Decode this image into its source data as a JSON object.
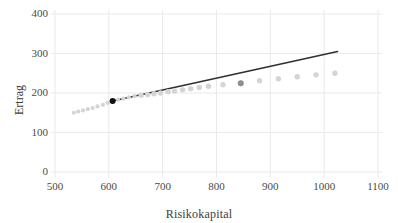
{
  "chart_data": {
    "type": "scatter",
    "title": "",
    "xlabel": "Risikokapital",
    "ylabel": "Ertrag",
    "xlim": [
      470,
      1140
    ],
    "ylim": [
      0,
      430
    ],
    "xticks": [
      500,
      600,
      700,
      800,
      900,
      1000,
      1100
    ],
    "yticks": [
      0,
      100,
      200,
      300,
      400
    ],
    "xtick_labels": [
      "500",
      "600",
      "700",
      "800",
      "900",
      "1000",
      "1100"
    ],
    "ytick_labels": [
      "0",
      "100",
      "200",
      "300",
      "400"
    ],
    "grid": true,
    "grid_color": "#e9e9ee",
    "legend": "none",
    "series": [
      {
        "name": "Effizienzkurve",
        "type": "scatter",
        "marker": "circle",
        "color": "#d4d4d4",
        "points": [
          {
            "x": 535,
            "y": 150
          },
          {
            "x": 543,
            "y": 153
          },
          {
            "x": 552,
            "y": 156
          },
          {
            "x": 561,
            "y": 159
          },
          {
            "x": 570,
            "y": 162
          },
          {
            "x": 579,
            "y": 166
          },
          {
            "x": 589,
            "y": 170
          },
          {
            "x": 598,
            "y": 175
          },
          {
            "x": 607,
            "y": 180
          },
          {
            "x": 617,
            "y": 183
          },
          {
            "x": 627,
            "y": 186
          },
          {
            "x": 637,
            "y": 189
          },
          {
            "x": 648,
            "y": 192
          },
          {
            "x": 660,
            "y": 194
          },
          {
            "x": 672,
            "y": 196
          },
          {
            "x": 684,
            "y": 198
          },
          {
            "x": 696,
            "y": 200
          },
          {
            "x": 710,
            "y": 203
          },
          {
            "x": 722,
            "y": 205
          },
          {
            "x": 737,
            "y": 208
          },
          {
            "x": 752,
            "y": 211
          },
          {
            "x": 768,
            "y": 214
          },
          {
            "x": 785,
            "y": 217
          },
          {
            "x": 812,
            "y": 221
          },
          {
            "x": 845,
            "y": 225
          },
          {
            "x": 880,
            "y": 231
          },
          {
            "x": 915,
            "y": 236
          },
          {
            "x": 950,
            "y": 241
          },
          {
            "x": 985,
            "y": 246
          },
          {
            "x": 1020,
            "y": 250
          }
        ]
      },
      {
        "name": "Tangentialportfolio",
        "type": "scatter",
        "marker": "circle",
        "color": "#121212",
        "points": [
          {
            "x": 607,
            "y": 180
          }
        ]
      },
      {
        "name": "Vergleichsportfolio",
        "type": "scatter",
        "marker": "circle",
        "color": "#8e8e8e",
        "points": [
          {
            "x": 845,
            "y": 225
          }
        ]
      },
      {
        "name": "Kapitalmarktlinie",
        "type": "line",
        "color": "#2f2f2f",
        "points": [
          {
            "x": 607,
            "y": 180
          },
          {
            "x": 1025,
            "y": 305
          }
        ]
      }
    ]
  }
}
